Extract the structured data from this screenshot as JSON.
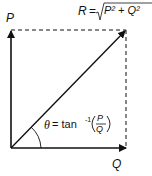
{
  "diagram": {
    "labels": {
      "p": "P",
      "q": "Q",
      "r": "R",
      "r_eq": "=",
      "r_expr": "P² + Q²",
      "theta": "θ",
      "theta_eq": "= tan",
      "theta_sup": "-1",
      "frac_num": "P",
      "frac_den": "Q"
    },
    "colors": {
      "line": "#111111",
      "background": "#ffffff"
    }
  }
}
